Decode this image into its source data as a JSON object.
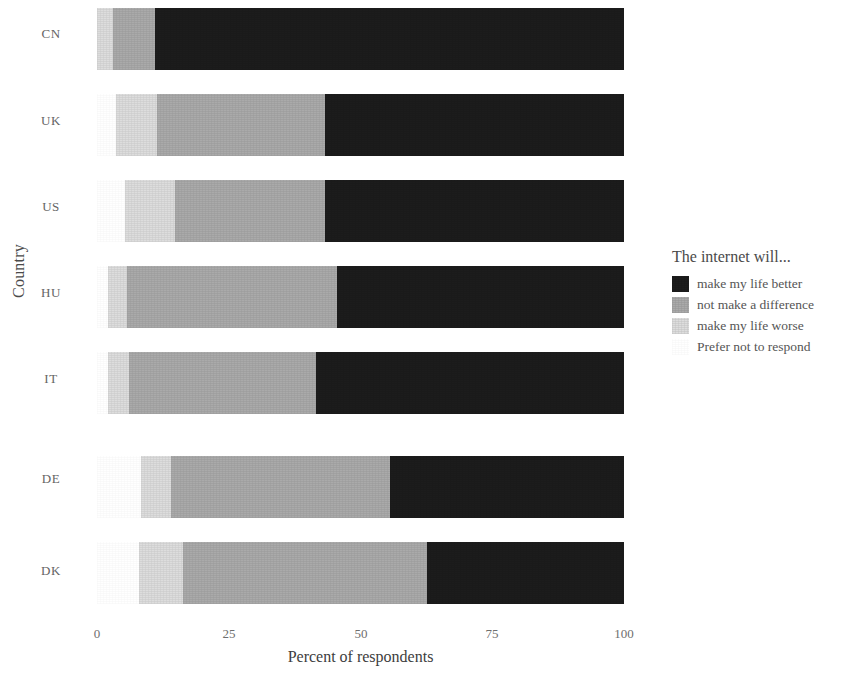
{
  "chart_data": {
    "type": "bar",
    "orientation": "horizontal",
    "stacked": true,
    "normalized": true,
    "title": "",
    "xlabel": "Percent of respondents",
    "ylabel": "Country",
    "xlim": [
      0,
      100
    ],
    "xticks": [
      "0",
      "25",
      "50",
      "75",
      "100"
    ],
    "grid": false,
    "legend_position": "right",
    "legend_title": "The internet will...",
    "categories": [
      "CN",
      "UK",
      "US",
      "HU",
      "IT",
      "DE",
      "DK"
    ],
    "series": [
      {
        "name": "make my life better",
        "color": "#1c1c1c",
        "values": [
          89.0,
          56.7,
          56.7,
          54.4,
          58.5,
          44.4,
          37.4
        ]
      },
      {
        "name": "not make a difference",
        "color": "#aaaaaa",
        "values": [
          8.0,
          32.0,
          28.5,
          40.0,
          35.5,
          41.6,
          46.3
        ]
      },
      {
        "name": "make my life worse",
        "color": "#dddddd",
        "values": [
          3.0,
          7.6,
          9.5,
          3.6,
          4.0,
          5.7,
          8.3
        ]
      },
      {
        "name": "Prefer not to respond",
        "color": "#ffffff",
        "values": [
          0.0,
          3.7,
          5.3,
          2.0,
          2.0,
          8.3,
          8.0
        ]
      }
    ],
    "stack_order": [
      "Prefer not to respond",
      "make my life worse",
      "not make a difference",
      "make my life better"
    ]
  },
  "axes": {
    "y_title": "Country",
    "x_title": "Percent of respondents",
    "y_tick_labels": [
      "CN",
      "UK",
      "US",
      "HU",
      "IT",
      "DE",
      "DK"
    ],
    "x_tick_labels": [
      "0",
      "25",
      "50",
      "75",
      "100"
    ]
  },
  "legend": {
    "title": "The internet will...",
    "items": [
      {
        "label": "make my life better",
        "color": "#1c1c1c"
      },
      {
        "label": "not make a difference",
        "color": "#aaaaaa"
      },
      {
        "label": "make my life worse",
        "color": "#dddddd"
      },
      {
        "label": "Prefer not to respond",
        "color": "#ffffff"
      }
    ]
  }
}
